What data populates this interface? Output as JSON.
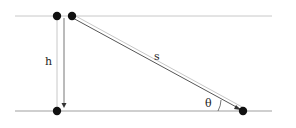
{
  "diagram": {
    "labels": {
      "height": "h",
      "slope": "s",
      "angle": "θ"
    },
    "colors": {
      "line": "#b0b0b0",
      "dark_line": "#555555",
      "dot": "#111111"
    }
  }
}
